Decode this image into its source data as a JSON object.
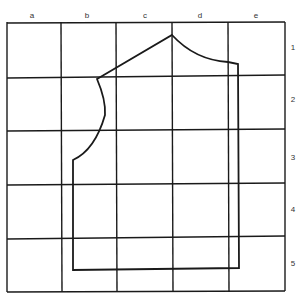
{
  "grid": {
    "columns": [
      "a",
      "b",
      "c",
      "d",
      "e"
    ],
    "rows": [
      "1",
      "2",
      "3",
      "4",
      "5"
    ],
    "col_x": [
      7,
      61,
      116,
      172,
      228,
      285
    ],
    "row_y": [
      22,
      76,
      130,
      184,
      237,
      291
    ],
    "line_color": "#1a1a1a"
  },
  "pattern": {
    "description": "Garment bodice pattern piece outline drawn over 5x5 grid",
    "stroke_color": "#1a1a1a"
  }
}
